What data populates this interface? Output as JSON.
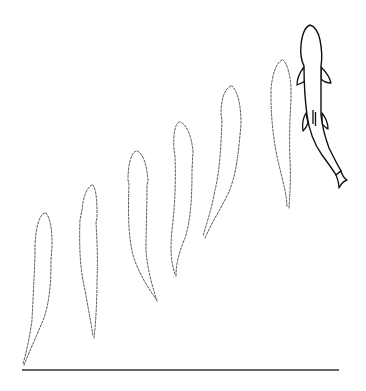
{
  "figure": {
    "type": "sequence-diagram",
    "subject": "fish swimming trajectory (successive positions)",
    "colors": {
      "background": "#ffffff",
      "ghost_outline": "#555555",
      "solid_outline": "#111111",
      "baseline": "#333333"
    },
    "baseline": {
      "x1": 22,
      "x2": 339,
      "y": 370
    },
    "ghost_positions": [
      {
        "index": 1,
        "head": [
          44,
          213
        ],
        "tail": [
          24,
          365
        ]
      },
      {
        "index": 2,
        "head": [
          93,
          185
        ],
        "tail": [
          93,
          338
        ]
      },
      {
        "index": 3,
        "head": [
          137,
          151
        ],
        "tail": [
          157,
          301
        ]
      },
      {
        "index": 4,
        "head": [
          180,
          122
        ],
        "tail": [
          175,
          275
        ]
      },
      {
        "index": 5,
        "head": [
          230,
          86
        ],
        "tail": [
          204,
          236
        ]
      },
      {
        "index": 6,
        "head": [
          283,
          60
        ],
        "tail": [
          287,
          208
        ]
      }
    ],
    "solid_fish": {
      "head": [
        310,
        25
      ],
      "tail": [
        340,
        180
      ],
      "style": "solid-outline"
    }
  }
}
